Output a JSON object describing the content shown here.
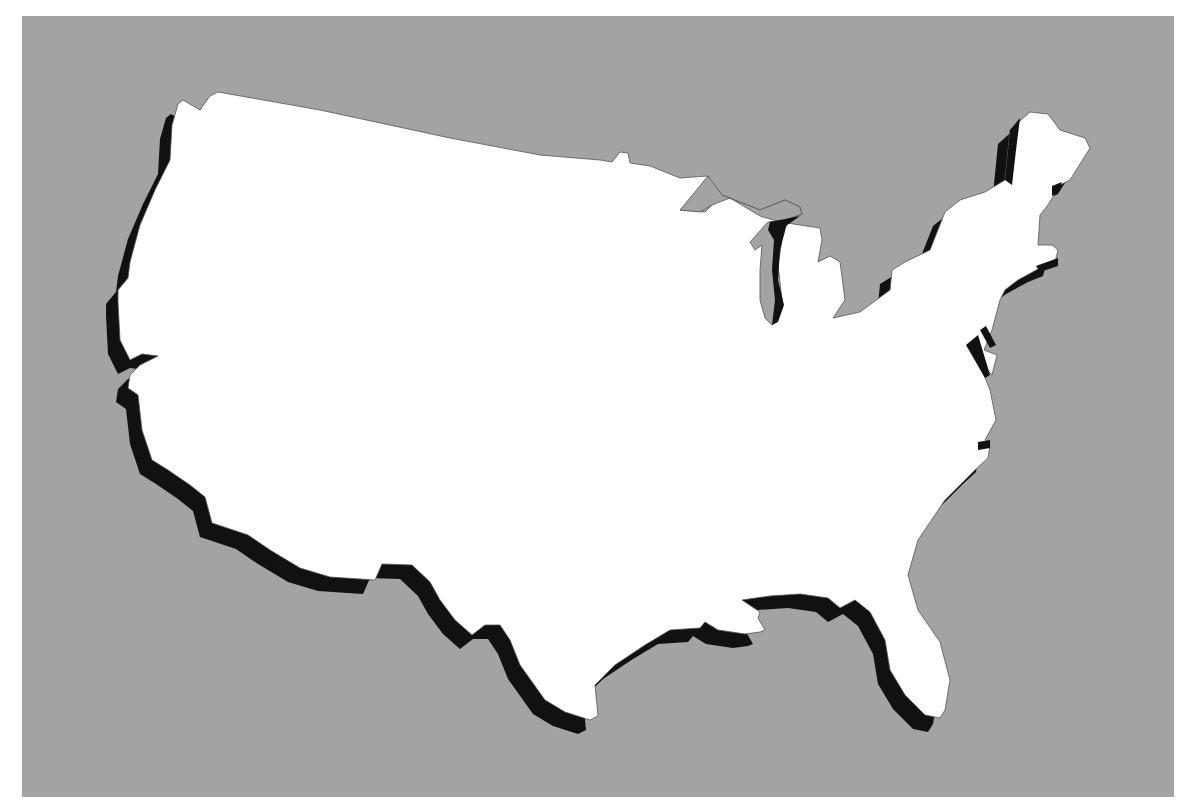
{
  "map": {
    "title": "",
    "subject": "Contiguous United States silhouette",
    "style": "white-landmass-with-black-drop-shadow",
    "colors": {
      "page_background": "#ffffff",
      "panel_background": "#a3a3a3",
      "landmass_fill": "#ffffff",
      "shadow_fill": "#111111",
      "outline_stroke": "#555555"
    },
    "shadow_offset": {
      "dx": -12,
      "dy": 14
    },
    "labels": [],
    "legend": [],
    "scale_bar": null
  }
}
